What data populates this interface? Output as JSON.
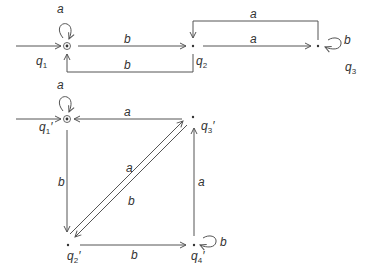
{
  "diagram": {
    "type": "automata-state-diagram",
    "colors": {
      "stroke": "#555555",
      "text": "#333333",
      "background": "#ffffff"
    },
    "top_automaton": {
      "states": [
        {
          "id": "q1",
          "label": "q",
          "sub": "1",
          "initial": true,
          "accepting": true
        },
        {
          "id": "q2",
          "label": "q",
          "sub": "2",
          "initial": false,
          "accepting": false
        },
        {
          "id": "q3",
          "label": "q",
          "sub": "3",
          "initial": false,
          "accepting": false
        }
      ],
      "transitions": [
        {
          "from": "q1",
          "to": "q1",
          "symbol": "a"
        },
        {
          "from": "q1",
          "to": "q2",
          "symbol": "b"
        },
        {
          "from": "q2",
          "to": "q1",
          "symbol": "b"
        },
        {
          "from": "q2",
          "to": "q3",
          "symbol": "a"
        },
        {
          "from": "q3",
          "to": "q2",
          "symbol": "a"
        },
        {
          "from": "q3",
          "to": "q3",
          "symbol": "b"
        }
      ]
    },
    "bottom_automaton": {
      "states": [
        {
          "id": "q1p",
          "label": "q",
          "sub": "1",
          "prime": "′",
          "initial": true,
          "accepting": true
        },
        {
          "id": "q2p",
          "label": "q",
          "sub": "2",
          "prime": "′",
          "initial": false,
          "accepting": false
        },
        {
          "id": "q3p",
          "label": "q",
          "sub": "3",
          "prime": "′",
          "initial": false,
          "accepting": false
        },
        {
          "id": "q4p",
          "label": "q",
          "sub": "4",
          "prime": "′",
          "initial": false,
          "accepting": false
        }
      ],
      "transitions": [
        {
          "from": "q1p",
          "to": "q1p",
          "symbol": "a"
        },
        {
          "from": "q1p",
          "to": "q2p",
          "symbol": "b"
        },
        {
          "from": "q3p",
          "to": "q1p",
          "symbol": "a"
        },
        {
          "from": "q2p",
          "to": "q3p",
          "symbol": "a"
        },
        {
          "from": "q3p",
          "to": "q2p",
          "symbol": "b"
        },
        {
          "from": "q2p",
          "to": "q4p",
          "symbol": "b"
        },
        {
          "from": "q4p",
          "to": "q3p",
          "symbol": "a"
        },
        {
          "from": "q4p",
          "to": "q4p",
          "symbol": "b"
        }
      ]
    }
  },
  "labels": {
    "top": {
      "q1_loop": "a",
      "q1_q2": "b",
      "q2_q1": "b",
      "q2_q3": "a",
      "q3_q2": "a",
      "q3_loop": "b"
    },
    "bottom": {
      "q1_loop": "a",
      "q3_q1": "a",
      "q1_q2": "b",
      "diag_a": "a",
      "diag_b": "b",
      "q4_q3": "a",
      "q2_q4": "b",
      "q4_loop": "b"
    }
  }
}
